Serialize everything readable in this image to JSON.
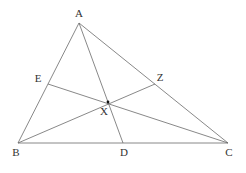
{
  "diagram": {
    "colors": {
      "line": "#6a6a6a",
      "text": "#333333",
      "point": "#111111"
    },
    "points": {
      "A": {
        "label": "A",
        "x": 79,
        "y": 23,
        "lx": 79,
        "ly": 17
      },
      "B": {
        "label": "B",
        "x": 18,
        "y": 143,
        "lx": 16,
        "ly": 156
      },
      "C": {
        "label": "C",
        "x": 228,
        "y": 143,
        "lx": 229,
        "ly": 156
      },
      "D": {
        "label": "D",
        "x": 123,
        "y": 143,
        "lx": 124,
        "ly": 156
      },
      "E": {
        "label": "E",
        "x": 48,
        "y": 84,
        "lx": 38,
        "ly": 82
      },
      "Z": {
        "label": "Z",
        "x": 155,
        "y": 84,
        "lx": 160,
        "ly": 81
      },
      "X": {
        "label": "X",
        "x": 108,
        "y": 102,
        "lx": 104,
        "ly": 115
      }
    },
    "segments": [
      {
        "name": "side-ab",
        "from": "A",
        "to": "B"
      },
      {
        "name": "side-bc",
        "from": "B",
        "to": "C"
      },
      {
        "name": "side-ca",
        "from": "C",
        "to": "A"
      },
      {
        "name": "cevian-ad",
        "from": "A",
        "to": "D"
      },
      {
        "name": "cevian-bz",
        "from": "B",
        "to": "Z"
      },
      {
        "name": "cevian-ce",
        "from": "C",
        "to": "E"
      }
    ]
  }
}
